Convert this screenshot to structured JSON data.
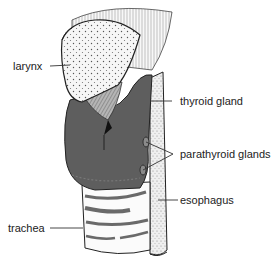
{
  "diagram": {
    "labels": {
      "larynx": "larynx",
      "thyroid": "thyroid gland",
      "parathyroid": "parathyroid glands",
      "esophagus": "esophagus",
      "trachea": "trachea"
    },
    "colors": {
      "thyroid_fill": "#5e5e5e",
      "cartilage_fill": "#f4f4f4",
      "esophagus_fill": "#ececec",
      "outline": "#222222",
      "trachea_ring": "#6a6a6a",
      "leader_line": "#333333"
    }
  }
}
